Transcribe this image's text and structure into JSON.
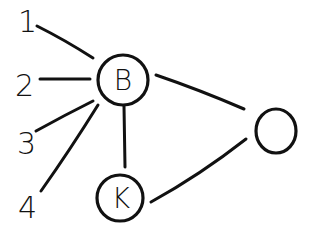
{
  "diagram": {
    "type": "graph",
    "style": "hand-drawn",
    "stroke_color": "#111111",
    "background": "#ffffff",
    "nodes": [
      {
        "id": "n1",
        "label": "1",
        "shape": "none"
      },
      {
        "id": "n2",
        "label": "2",
        "shape": "none"
      },
      {
        "id": "n3",
        "label": "3",
        "shape": "none"
      },
      {
        "id": "n4",
        "label": "4",
        "shape": "none"
      },
      {
        "id": "B",
        "label": "B",
        "shape": "circle"
      },
      {
        "id": "K",
        "label": "K",
        "shape": "circle"
      },
      {
        "id": "O",
        "label": "",
        "shape": "circle"
      }
    ],
    "edges": [
      {
        "from": "n1",
        "to": "B"
      },
      {
        "from": "n2",
        "to": "B"
      },
      {
        "from": "n3",
        "to": "B"
      },
      {
        "from": "n4",
        "to": "B"
      },
      {
        "from": "B",
        "to": "K"
      },
      {
        "from": "B",
        "to": "O"
      },
      {
        "from": "K",
        "to": "O"
      }
    ]
  }
}
